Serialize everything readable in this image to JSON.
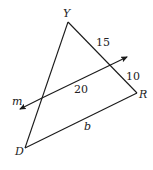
{
  "diagram": {
    "vertices": {
      "Y": {
        "label": "Y",
        "x": 68,
        "y": 22
      },
      "R": {
        "label": "R",
        "x": 137,
        "y": 93
      },
      "D": {
        "label": "D",
        "x": 25,
        "y": 148
      }
    },
    "line_m": {
      "label": "m",
      "start": {
        "x": 18,
        "y": 110
      },
      "end": {
        "x": 129,
        "y": 56
      },
      "bidirectional_arrows": true
    },
    "segment_labels": {
      "upper_YR": "15",
      "lower_YR": "10",
      "inner_segment": "20",
      "base_DR": "b"
    },
    "colors": {
      "stroke": "#1a1a1a",
      "text": "#222222",
      "background": "#ffffff"
    }
  }
}
